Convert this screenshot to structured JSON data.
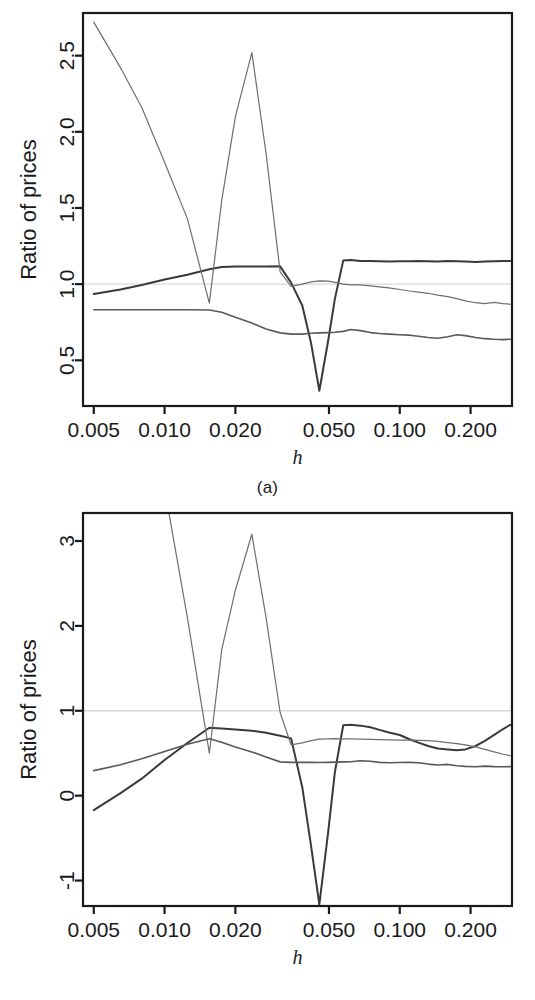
{
  "figure": {
    "panels": [
      {
        "key": "a",
        "caption": "(a)",
        "ylabel": "Ratio of prices",
        "xlabel": "h"
      },
      {
        "key": "b",
        "caption": "(b)",
        "ylabel": "Ratio of prices",
        "xlabel": "h"
      }
    ]
  },
  "chart_data": [
    {
      "type": "line",
      "panel": "a",
      "title": "",
      "xlabel": "h",
      "ylabel": "Ratio of prices",
      "xscale": "log",
      "xlim": [
        0.0045,
        0.3
      ],
      "ylim": [
        0.2,
        2.78
      ],
      "xticks": [
        0.005,
        0.01,
        0.02,
        0.05,
        0.1,
        0.2
      ],
      "xticklabels": [
        "0.005",
        "0.010",
        "0.020",
        "0.050",
        "0.100",
        "0.200"
      ],
      "yticks": [
        0.5,
        1.0,
        1.5,
        2.0,
        2.5
      ],
      "yticklabels": [
        "0.5",
        "1.0",
        "1.5",
        "2.0",
        "2.5"
      ],
      "grid": false,
      "legend": "none",
      "reference_line": {
        "y": 1.0,
        "color": "#d9d9d9",
        "orientation": "horizontal"
      },
      "series": [
        {
          "name": "series-1-dark",
          "color": "#3a3a3a",
          "width": 2.0,
          "x": [
            0.005,
            0.0065,
            0.008,
            0.01,
            0.0125,
            0.0155,
            0.0175,
            0.02,
            0.0235,
            0.027,
            0.031,
            0.0345,
            0.0385,
            0.042,
            0.0455,
            0.0495,
            0.053,
            0.0575,
            0.062,
            0.068,
            0.075,
            0.082,
            0.09,
            0.1,
            0.11,
            0.12,
            0.132,
            0.145,
            0.16,
            0.175,
            0.19,
            0.21,
            0.23,
            0.252,
            0.275,
            0.295
          ],
          "y": [
            0.935,
            0.965,
            0.995,
            1.03,
            1.062,
            1.098,
            1.112,
            1.115,
            1.115,
            1.115,
            1.117,
            1.01,
            0.86,
            0.61,
            0.3,
            0.62,
            0.905,
            1.155,
            1.158,
            1.152,
            1.152,
            1.15,
            1.148,
            1.15,
            1.15,
            1.152,
            1.15,
            1.148,
            1.152,
            1.15,
            1.148,
            1.146,
            1.148,
            1.15,
            1.152,
            1.152
          ]
        },
        {
          "name": "series-2-thin-spiky",
          "color": "#6e6e6e",
          "width": 1.2,
          "x": [
            0.005,
            0.0065,
            0.008,
            0.01,
            0.0125,
            0.0155,
            0.0175,
            0.02,
            0.0235,
            0.027,
            0.031,
            0.0345,
            0.0385,
            0.042,
            0.0455,
            0.0495,
            0.053,
            0.0575,
            0.062,
            0.068,
            0.075,
            0.082,
            0.09,
            0.1,
            0.11,
            0.12,
            0.132,
            0.145,
            0.16,
            0.175,
            0.19,
            0.21,
            0.23,
            0.252,
            0.275,
            0.295
          ],
          "y": [
            2.72,
            2.42,
            2.16,
            1.8,
            1.43,
            0.875,
            1.55,
            2.1,
            2.52,
            1.86,
            1.08,
            0.985,
            1.0,
            1.015,
            1.022,
            1.02,
            1.012,
            1.0,
            0.995,
            0.995,
            0.988,
            0.982,
            0.975,
            0.965,
            0.955,
            0.948,
            0.94,
            0.928,
            0.918,
            0.905,
            0.89,
            0.878,
            0.872,
            0.88,
            0.872,
            0.868
          ]
        },
        {
          "name": "series-3-mid-flat",
          "color": "#585858",
          "width": 1.6,
          "x": [
            0.005,
            0.0065,
            0.008,
            0.01,
            0.0125,
            0.0155,
            0.0175,
            0.02,
            0.0235,
            0.027,
            0.031,
            0.0345,
            0.0385,
            0.042,
            0.0455,
            0.0495,
            0.053,
            0.0575,
            0.062,
            0.068,
            0.075,
            0.082,
            0.09,
            0.1,
            0.11,
            0.12,
            0.132,
            0.145,
            0.16,
            0.175,
            0.19,
            0.21,
            0.23,
            0.252,
            0.275,
            0.295
          ],
          "y": [
            0.832,
            0.832,
            0.832,
            0.832,
            0.832,
            0.83,
            0.815,
            0.782,
            0.745,
            0.705,
            0.68,
            0.672,
            0.672,
            0.678,
            0.68,
            0.682,
            0.684,
            0.69,
            0.702,
            0.695,
            0.682,
            0.676,
            0.672,
            0.668,
            0.665,
            0.658,
            0.65,
            0.645,
            0.655,
            0.668,
            0.662,
            0.65,
            0.642,
            0.638,
            0.636,
            0.638
          ]
        }
      ]
    },
    {
      "type": "line",
      "panel": "b",
      "title": "",
      "xlabel": "h",
      "ylabel": "Ratio of prices",
      "xscale": "log",
      "xlim": [
        0.0045,
        0.3
      ],
      "ylim": [
        -1.3,
        3.33
      ],
      "xticks": [
        0.005,
        0.01,
        0.02,
        0.05,
        0.1,
        0.2
      ],
      "xticklabels": [
        "0.005",
        "0.010",
        "0.020",
        "0.050",
        "0.100",
        "0.200"
      ],
      "yticks": [
        -1,
        0,
        1,
        2,
        3
      ],
      "yticklabels": [
        "-1",
        "0",
        "1",
        "2",
        "3"
      ],
      "grid": false,
      "legend": "none",
      "reference_line": {
        "y": 1.0,
        "color": "#d9d9d9",
        "orientation": "horizontal"
      },
      "series": [
        {
          "name": "series-1-dark",
          "color": "#3a3a3a",
          "width": 2.0,
          "x": [
            0.005,
            0.0065,
            0.008,
            0.01,
            0.0125,
            0.0155,
            0.0175,
            0.02,
            0.0235,
            0.027,
            0.031,
            0.0345,
            0.0385,
            0.042,
            0.0455,
            0.0495,
            0.053,
            0.0575,
            0.062,
            0.068,
            0.075,
            0.082,
            0.09,
            0.1,
            0.11,
            0.12,
            0.132,
            0.145,
            0.16,
            0.175,
            0.19,
            0.21,
            0.23,
            0.252,
            0.275,
            0.295
          ],
          "y": [
            -0.17,
            0.03,
            0.2,
            0.42,
            0.62,
            0.8,
            0.79,
            0.78,
            0.765,
            0.74,
            0.705,
            0.675,
            0.1,
            -0.6,
            -1.28,
            -0.45,
            0.28,
            0.83,
            0.835,
            0.825,
            0.805,
            0.775,
            0.745,
            0.715,
            0.665,
            0.625,
            0.585,
            0.555,
            0.545,
            0.535,
            0.545,
            0.585,
            0.645,
            0.715,
            0.785,
            0.835
          ]
        },
        {
          "name": "series-2-thin-spiky",
          "color": "#6e6e6e",
          "width": 1.2,
          "x": [
            0.005,
            0.0065,
            0.008,
            0.01,
            0.0125,
            0.0155,
            0.0175,
            0.02,
            0.0235,
            0.027,
            0.031,
            0.0345,
            0.0385,
            0.042,
            0.0455,
            0.0495,
            0.053,
            0.0575,
            0.062,
            0.068,
            0.075,
            0.082,
            0.09,
            0.1,
            0.11,
            0.12,
            0.132,
            0.145,
            0.16,
            0.175,
            0.19,
            0.21,
            0.23,
            0.252,
            0.275,
            0.295
          ],
          "y": [
            7.3,
            6.1,
            5.0,
            3.62,
            2.1,
            0.5,
            1.72,
            2.42,
            3.08,
            2.1,
            0.98,
            0.598,
            0.622,
            0.648,
            0.665,
            0.67,
            0.672,
            0.67,
            0.668,
            0.665,
            0.662,
            0.66,
            0.658,
            0.655,
            0.655,
            0.652,
            0.648,
            0.64,
            0.625,
            0.612,
            0.598,
            0.575,
            0.545,
            0.515,
            0.488,
            0.47
          ]
        },
        {
          "name": "series-3-mid-flat",
          "color": "#585858",
          "width": 1.6,
          "x": [
            0.005,
            0.0065,
            0.008,
            0.01,
            0.0125,
            0.0155,
            0.0175,
            0.02,
            0.0235,
            0.027,
            0.031,
            0.0345,
            0.0385,
            0.042,
            0.0455,
            0.0495,
            0.053,
            0.0575,
            0.062,
            0.068,
            0.075,
            0.082,
            0.09,
            0.1,
            0.11,
            0.12,
            0.132,
            0.145,
            0.16,
            0.175,
            0.19,
            0.21,
            0.23,
            0.252,
            0.275,
            0.295
          ],
          "y": [
            0.295,
            0.365,
            0.435,
            0.52,
            0.605,
            0.67,
            0.628,
            0.572,
            0.515,
            0.455,
            0.398,
            0.392,
            0.392,
            0.392,
            0.39,
            0.392,
            0.395,
            0.398,
            0.4,
            0.412,
            0.405,
            0.392,
            0.388,
            0.39,
            0.392,
            0.388,
            0.372,
            0.362,
            0.368,
            0.352,
            0.345,
            0.34,
            0.348,
            0.342,
            0.34,
            0.342
          ]
        }
      ]
    }
  ]
}
